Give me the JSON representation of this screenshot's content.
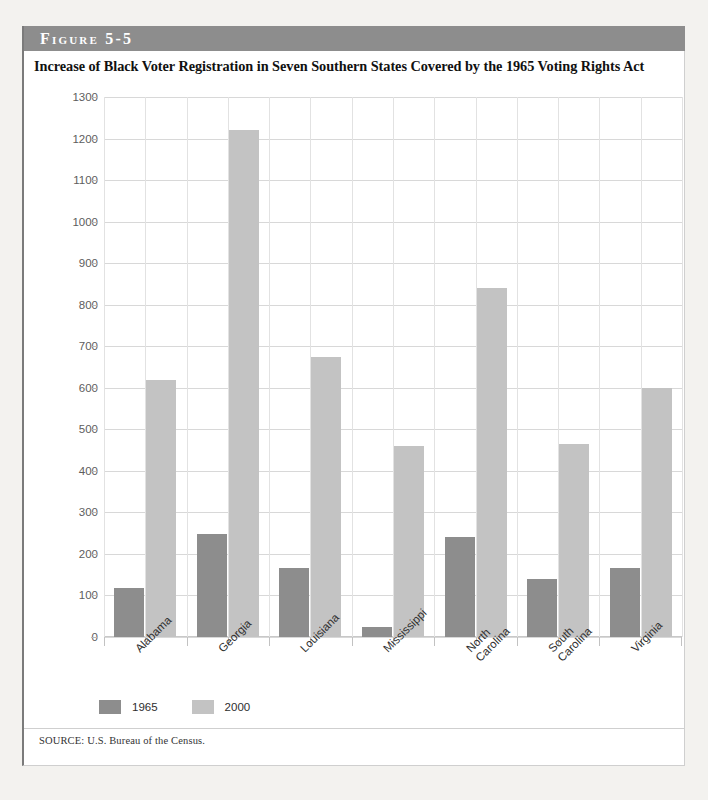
{
  "figure": {
    "banner_label": "Figure 5-5",
    "title": "Increase of Black Voter Registration in Seven Southern States Covered by the 1965 Voting Rights Act",
    "source_note": "SOURCE: U.S. Bureau of the Census."
  },
  "colors": {
    "banner_bg": "#8d8d8d",
    "series_1965": "#8d8d8d",
    "series_2000": "#c3c3c3",
    "gridline": "#d8d8d8",
    "panel_bg": "#ffffff",
    "page_bg": "#f3f2ef"
  },
  "chart_data": {
    "type": "bar",
    "title": "Increase of Black Voter Registration in Seven Southern States Covered by the 1965 Voting Rights Act",
    "xlabel": "",
    "ylabel": "Number of voters (in thousands)",
    "ylim": [
      0,
      1300
    ],
    "ytick_step": 100,
    "yticks": [
      0,
      100,
      200,
      300,
      400,
      500,
      600,
      700,
      800,
      900,
      1000,
      1100,
      1200,
      1300
    ],
    "ytick_labels": [
      "0",
      "100",
      "200",
      "300",
      "400",
      "500",
      "600",
      "700",
      "800",
      "900",
      "1000",
      "1100",
      "1200",
      "1300"
    ],
    "grid": true,
    "grid_axes": "both",
    "legend_position": "below-left",
    "categories": [
      "Alabama",
      "Georgia",
      "Louisiana",
      "Mississippi",
      "North Carolina",
      "South Carolina",
      "Virginia"
    ],
    "category_label_lines": [
      [
        "Alabama"
      ],
      [
        "Georgia"
      ],
      [
        "Louisiana"
      ],
      [
        "Mississippi"
      ],
      [
        "North",
        "Carolina"
      ],
      [
        "South",
        "Carolina"
      ],
      [
        "Virginia"
      ]
    ],
    "series": [
      {
        "name": "1965",
        "color": "#8d8d8d",
        "values": [
          118,
          248,
          165,
          25,
          240,
          140,
          165
        ]
      },
      {
        "name": "2000",
        "color": "#c3c3c3",
        "values": [
          618,
          1220,
          675,
          460,
          840,
          465,
          600
        ]
      }
    ]
  }
}
